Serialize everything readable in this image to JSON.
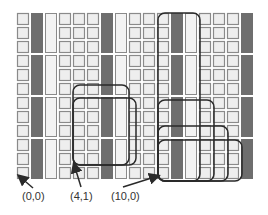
{
  "diagram": {
    "grid": {
      "origin_x": 17,
      "origin_y": 13,
      "pitch": 14,
      "cell_size": 11,
      "columns": [
        "square",
        "dark",
        "light",
        "square",
        "square",
        "square",
        "dark",
        "light",
        "square",
        "square",
        "square",
        "dark",
        "light",
        "square",
        "square",
        "square",
        "dark"
      ],
      "rows": 12,
      "bar_group_rows": 3
    },
    "colors": {
      "square_fill": "#eeeeee",
      "square_stroke": "#8a8a8a",
      "dark_bar": "#6e6e6e",
      "light_bar": "#f3f3f3",
      "outline": "#2a2a2a",
      "label": "#333333"
    },
    "outlines": [
      {
        "x": 73,
        "y": 85,
        "w": 56,
        "h": 80
      },
      {
        "x": 73,
        "y": 98,
        "w": 63,
        "h": 67
      },
      {
        "x": 158,
        "y": 13,
        "w": 42,
        "h": 168
      },
      {
        "x": 158,
        "y": 100,
        "w": 56,
        "h": 81
      },
      {
        "x": 158,
        "y": 126,
        "w": 70,
        "h": 55
      },
      {
        "x": 158,
        "y": 140,
        "w": 84,
        "h": 41
      }
    ],
    "labels": [
      {
        "text": "(0,0)",
        "x": 22,
        "y": 190
      },
      {
        "text": "(4,1)",
        "x": 70,
        "y": 190
      },
      {
        "text": "(10,0)",
        "x": 111,
        "y": 190
      }
    ],
    "arrows": [
      {
        "x1": 33,
        "y1": 188,
        "x2": 19,
        "y2": 176
      },
      {
        "x1": 81,
        "y1": 187,
        "x2": 74,
        "y2": 164
      },
      {
        "x1": 123,
        "y1": 187,
        "x2": 158,
        "y2": 176
      }
    ]
  }
}
